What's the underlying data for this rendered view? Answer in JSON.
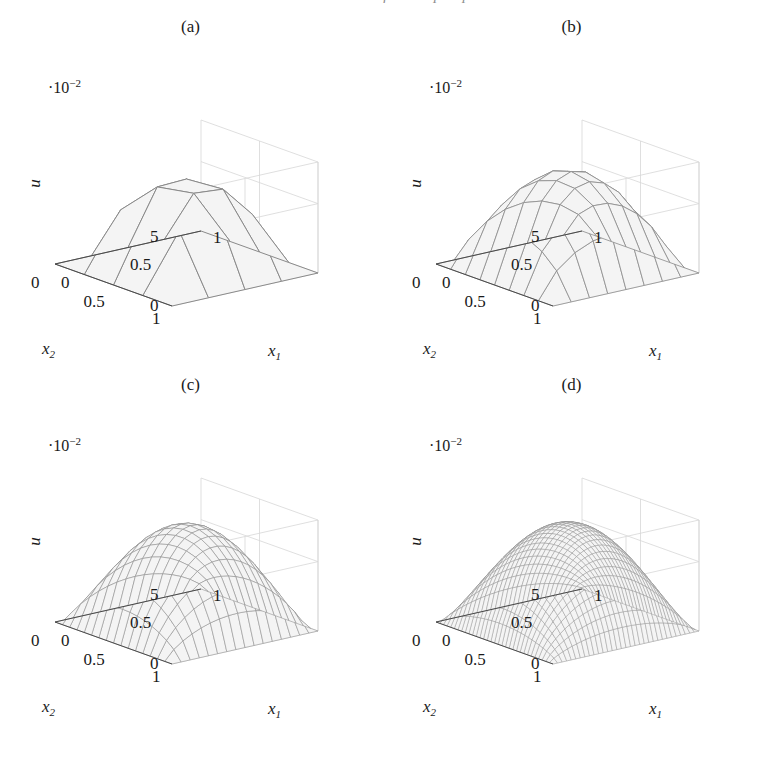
{
  "figure": {
    "cutoff_header": "Numerical solution of an elliptic problem",
    "background_color": "#ffffff",
    "surface_fill_color": "#f4f4f4",
    "mesh_line_color": "#8a8a8a",
    "axis_line_color": "#4a4a4a",
    "grid_line_color": "#d7d7d7",
    "text_color": "#1a1a1a"
  },
  "axes": {
    "z_multiplier": "·10",
    "z_multiplier_exponent": "−2",
    "z_label": "u",
    "z_ticks": [
      "5",
      "0"
    ],
    "z_tick_values": [
      5,
      0
    ],
    "x1_label": "x",
    "x1_sub": "1",
    "x2_label": "x",
    "x2_sub": "2",
    "x1_ticks": [
      "0",
      "0.5",
      "1"
    ],
    "x2_ticks": [
      "1",
      "0.5",
      "0"
    ]
  },
  "panels": [
    {
      "id": "a",
      "caption": "(a)",
      "mesh_n": 4,
      "peak_value": 0.0645,
      "shading": "flat-coarse"
    },
    {
      "id": "b",
      "caption": "(b)",
      "mesh_n": 8,
      "peak_value": 0.07,
      "shading": "flat-medium"
    },
    {
      "id": "c",
      "caption": "(c)",
      "mesh_n": 16,
      "peak_value": 0.073,
      "shading": "fine"
    },
    {
      "id": "d",
      "caption": "(d)",
      "mesh_n": 32,
      "peak_value": 0.074,
      "shading": "very-fine"
    }
  ],
  "chart_data": {
    "type": "surface",
    "title": "",
    "xlabel": "x_1",
    "ylabel": "x_2",
    "zlabel": "u",
    "z_scale": "1e-2",
    "zlim": [
      0,
      0.08
    ],
    "xlim": [
      0,
      1
    ],
    "ylim": [
      0,
      1
    ],
    "xticks": [
      0,
      0.5,
      1
    ],
    "yticks": [
      0,
      0.5,
      1
    ],
    "zticks": [
      0,
      0.05
    ],
    "grid": true,
    "legend": "none",
    "view": {
      "azimuth": -37.5,
      "elevation": 30
    },
    "function": "bubble u(x1,x2) = A * (x1*(1-x1)*x2*(1-x2))^p, peak near centre",
    "subplots": [
      {
        "label": "(a)",
        "mesh": "4x4",
        "elements": 32,
        "peak_u": 0.0645
      },
      {
        "label": "(b)",
        "mesh": "8x8",
        "elements": 128,
        "peak_u": 0.07
      },
      {
        "label": "(c)",
        "mesh": "16x16",
        "elements": 512,
        "peak_u": 0.073
      },
      {
        "label": "(d)",
        "mesh": "32x32",
        "elements": 2048,
        "peak_u": 0.074
      }
    ]
  }
}
